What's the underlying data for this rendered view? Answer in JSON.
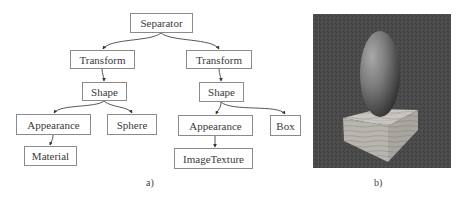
{
  "diagram": {
    "type": "scene-graph-tree",
    "nodes": [
      {
        "id": "separator",
        "label": "Separator",
        "parent": null
      },
      {
        "id": "transform-left",
        "label": "Transform",
        "parent": "separator"
      },
      {
        "id": "shape-left",
        "label": "Shape",
        "parent": "transform-left"
      },
      {
        "id": "appearance-left",
        "label": "Appearance",
        "parent": "shape-left"
      },
      {
        "id": "sphere",
        "label": "Sphere",
        "parent": "shape-left"
      },
      {
        "id": "material",
        "label": "Material",
        "parent": "appearance-left"
      },
      {
        "id": "transform-right",
        "label": "Transform",
        "parent": "separator"
      },
      {
        "id": "shape-right",
        "label": "Shape",
        "parent": "transform-right"
      },
      {
        "id": "appearance-right",
        "label": "Appearance",
        "parent": "shape-right"
      },
      {
        "id": "box",
        "label": "Box",
        "parent": "shape-right"
      },
      {
        "id": "imagetexture",
        "label": "ImageTexture",
        "parent": "appearance-right"
      }
    ],
    "caption": "a)"
  },
  "render": {
    "description": "Rendered 3D scene: a stretched sphere (ellipsoid) standing on a wood-textured box on a dark gray background",
    "background_color": "#4a4a4a",
    "caption": "b)"
  }
}
